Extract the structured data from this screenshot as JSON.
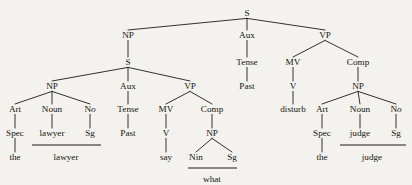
{
  "figure": {
    "kind": "syntactic-parse-tree",
    "background_color": "#f4f2ee",
    "ink_color": "#15130f",
    "sentence": "the lawyer Past say what the judge Past disturb"
  },
  "nodes": [
    {
      "id": "s-root",
      "label": "S",
      "x": 247,
      "y": 16,
      "kind": "nonterminal"
    },
    {
      "id": "np-subj",
      "label": "NP",
      "x": 128,
      "y": 38,
      "kind": "nonterminal"
    },
    {
      "id": "aux-main",
      "label": "Aux",
      "x": 247,
      "y": 38,
      "kind": "nonterminal"
    },
    {
      "id": "vp-main",
      "label": "VP",
      "x": 325,
      "y": 38,
      "kind": "nonterminal"
    },
    {
      "id": "s-embed",
      "label": "S",
      "x": 128,
      "y": 65,
      "kind": "nonterminal"
    },
    {
      "id": "tense-main",
      "label": "Tense",
      "x": 247,
      "y": 65,
      "kind": "nonterminal"
    },
    {
      "id": "mv-main",
      "label": "MV",
      "x": 293,
      "y": 65,
      "kind": "nonterminal"
    },
    {
      "id": "comp-main",
      "label": "Comp",
      "x": 358,
      "y": 65,
      "kind": "nonterminal"
    },
    {
      "id": "np-embed",
      "label": "NP",
      "x": 52,
      "y": 89,
      "kind": "nonterminal"
    },
    {
      "id": "aux-embed",
      "label": "Aux",
      "x": 128,
      "y": 89,
      "kind": "nonterminal"
    },
    {
      "id": "vp-embed",
      "label": "VP",
      "x": 190,
      "y": 89,
      "kind": "nonterminal"
    },
    {
      "id": "past-main",
      "label": "Past",
      "x": 247,
      "y": 89,
      "kind": "terminal"
    },
    {
      "id": "v-main",
      "label": "V",
      "x": 293,
      "y": 89,
      "kind": "nonterminal"
    },
    {
      "id": "np-obj",
      "label": "NP",
      "x": 358,
      "y": 89,
      "kind": "nonterminal"
    },
    {
      "id": "art-l",
      "label": "Art",
      "x": 15,
      "y": 112,
      "kind": "nonterminal"
    },
    {
      "id": "noun-l",
      "label": "Noun",
      "x": 52,
      "y": 112,
      "kind": "nonterminal"
    },
    {
      "id": "no-l",
      "label": "No",
      "x": 90,
      "y": 112,
      "kind": "nonterminal",
      "italic_tail": 1
    },
    {
      "id": "tense-embed",
      "label": "Tense",
      "x": 128,
      "y": 112,
      "kind": "nonterminal"
    },
    {
      "id": "mv-embed",
      "label": "MV",
      "x": 166,
      "y": 112,
      "kind": "nonterminal"
    },
    {
      "id": "comp-embed",
      "label": "Comp",
      "x": 212,
      "y": 112,
      "kind": "nonterminal"
    },
    {
      "id": "disturb",
      "label": "disturb",
      "x": 293,
      "y": 112,
      "kind": "terminal"
    },
    {
      "id": "art-r",
      "label": "Art",
      "x": 322,
      "y": 112,
      "kind": "nonterminal"
    },
    {
      "id": "noun-r",
      "label": "Noun",
      "x": 360,
      "y": 112,
      "kind": "nonterminal"
    },
    {
      "id": "no-r",
      "label": "No",
      "x": 396,
      "y": 112,
      "kind": "nonterminal",
      "italic_tail": 1
    },
    {
      "id": "spec-l",
      "label": "Spec",
      "x": 15,
      "y": 136,
      "kind": "terminal"
    },
    {
      "id": "lawyer-1",
      "label": "lawyer",
      "x": 52,
      "y": 136,
      "kind": "terminal"
    },
    {
      "id": "sg-l",
      "label": "Sg",
      "x": 90,
      "y": 136,
      "kind": "terminal"
    },
    {
      "id": "past-embed",
      "label": "Past",
      "x": 128,
      "y": 136,
      "kind": "terminal"
    },
    {
      "id": "v-embed",
      "label": "V",
      "x": 166,
      "y": 136,
      "kind": "nonterminal"
    },
    {
      "id": "np-wh",
      "label": "NP",
      "x": 212,
      "y": 136,
      "kind": "nonterminal"
    },
    {
      "id": "spec-r",
      "label": "Spec",
      "x": 322,
      "y": 136,
      "kind": "terminal"
    },
    {
      "id": "judge-1",
      "label": "judge",
      "x": 360,
      "y": 136,
      "kind": "terminal"
    },
    {
      "id": "sg-r",
      "label": "Sg",
      "x": 396,
      "y": 136,
      "kind": "terminal"
    },
    {
      "id": "the-l",
      "label": "the",
      "x": 15,
      "y": 160,
      "kind": "terminal"
    },
    {
      "id": "lawyer-2",
      "label": "lawyer",
      "x": 66,
      "y": 160,
      "kind": "terminal"
    },
    {
      "id": "say",
      "label": "say",
      "x": 166,
      "y": 160,
      "kind": "terminal"
    },
    {
      "id": "nin",
      "label": "Nin",
      "x": 196,
      "y": 160,
      "kind": "terminal"
    },
    {
      "id": "sg-wh",
      "label": "Sg",
      "x": 232,
      "y": 160,
      "kind": "terminal"
    },
    {
      "id": "the-r",
      "label": "the",
      "x": 322,
      "y": 160,
      "kind": "terminal"
    },
    {
      "id": "judge-2",
      "label": "judge",
      "x": 372,
      "y": 160,
      "kind": "terminal"
    },
    {
      "id": "what",
      "label": "what",
      "x": 212,
      "y": 182,
      "kind": "terminal"
    }
  ],
  "edges": [
    {
      "from": "s-root",
      "to": "np-subj"
    },
    {
      "from": "s-root",
      "to": "aux-main"
    },
    {
      "from": "s-root",
      "to": "vp-main"
    },
    {
      "from": "np-subj",
      "to": "s-embed"
    },
    {
      "from": "aux-main",
      "to": "tense-main"
    },
    {
      "from": "vp-main",
      "to": "mv-main"
    },
    {
      "from": "vp-main",
      "to": "comp-main"
    },
    {
      "from": "s-embed",
      "to": "np-embed"
    },
    {
      "from": "s-embed",
      "to": "aux-embed"
    },
    {
      "from": "s-embed",
      "to": "vp-embed"
    },
    {
      "from": "tense-main",
      "to": "past-main"
    },
    {
      "from": "mv-main",
      "to": "v-main"
    },
    {
      "from": "comp-main",
      "to": "np-obj"
    },
    {
      "from": "np-embed",
      "to": "art-l"
    },
    {
      "from": "np-embed",
      "to": "noun-l"
    },
    {
      "from": "np-embed",
      "to": "no-l"
    },
    {
      "from": "aux-embed",
      "to": "tense-embed"
    },
    {
      "from": "vp-embed",
      "to": "mv-embed"
    },
    {
      "from": "vp-embed",
      "to": "comp-embed"
    },
    {
      "from": "v-main",
      "to": "disturb"
    },
    {
      "from": "np-obj",
      "to": "art-r"
    },
    {
      "from": "np-obj",
      "to": "noun-r"
    },
    {
      "from": "np-obj",
      "to": "no-r"
    },
    {
      "from": "art-l",
      "to": "spec-l"
    },
    {
      "from": "noun-l",
      "to": "lawyer-1"
    },
    {
      "from": "no-l",
      "to": "sg-l"
    },
    {
      "from": "tense-embed",
      "to": "past-embed"
    },
    {
      "from": "mv-embed",
      "to": "v-embed"
    },
    {
      "from": "comp-embed",
      "to": "np-wh"
    },
    {
      "from": "art-r",
      "to": "spec-r"
    },
    {
      "from": "noun-r",
      "to": "judge-1"
    },
    {
      "from": "no-r",
      "to": "sg-r"
    },
    {
      "from": "spec-l",
      "to": "the-l"
    },
    {
      "from": "v-embed",
      "to": "say"
    },
    {
      "from": "np-wh",
      "to": "nin"
    },
    {
      "from": "np-wh",
      "to": "sg-wh"
    },
    {
      "from": "spec-r",
      "to": "the-r"
    }
  ],
  "rules": [
    {
      "id": "rule-lawyer",
      "label": "lawyer-affix-rule",
      "x1": 32,
      "x2": 101,
      "y": 145
    },
    {
      "id": "rule-what",
      "label": "what-affix-rule",
      "x1": 188,
      "x2": 237,
      "y": 168
    },
    {
      "id": "rule-judge",
      "label": "judge-affix-rule",
      "x1": 340,
      "x2": 406,
      "y": 145
    }
  ],
  "legend": {
    "nonterminals": [
      "S",
      "NP",
      "VP",
      "Aux",
      "MV",
      "Comp",
      "Art",
      "Noun",
      "No",
      "Tense",
      "V"
    ],
    "terminals": [
      "the",
      "lawyer",
      "Sg",
      "Past",
      "say",
      "Nin",
      "what",
      "disturb",
      "judge",
      "Spec"
    ]
  }
}
